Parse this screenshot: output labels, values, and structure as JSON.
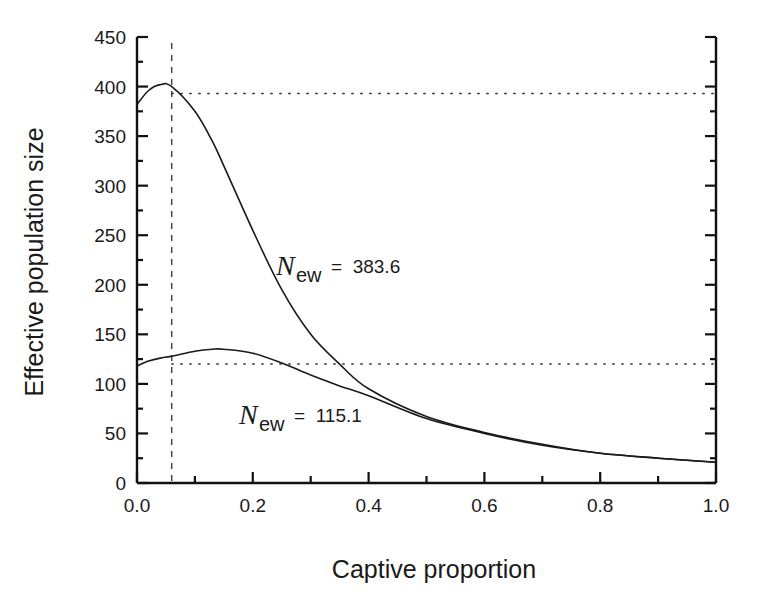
{
  "chart_data": {
    "type": "line",
    "title": "",
    "xlabel": "Captive proportion",
    "ylabel": "Effective population size",
    "xlim": [
      0.0,
      1.0
    ],
    "ylim": [
      0,
      450
    ],
    "grid": false,
    "legend": null,
    "x_ticks": [
      "0.0",
      "0.2",
      "0.4",
      "0.6",
      "0.8",
      "1.0"
    ],
    "y_ticks": [
      "0",
      "50",
      "100",
      "150",
      "200",
      "250",
      "300",
      "350",
      "400",
      "450"
    ],
    "x": [
      0.0,
      0.02,
      0.04,
      0.06,
      0.1,
      0.13,
      0.15,
      0.2,
      0.25,
      0.3,
      0.35,
      0.4,
      0.5,
      0.6,
      0.7,
      0.8,
      0.9,
      1.0
    ],
    "series": [
      {
        "name": "N_ew = 383.6",
        "values": [
          382,
          396,
          402,
          400,
          375,
          345,
          320,
          255,
          195,
          150,
          120,
          95,
          67,
          51,
          39,
          30,
          25,
          21
        ]
      },
      {
        "name": "N_ew = 115.1",
        "values": [
          118,
          123,
          126,
          128,
          133,
          135,
          135,
          131,
          121,
          109,
          98,
          88,
          65,
          50,
          38,
          30,
          25,
          21
        ]
      }
    ],
    "reference_lines": [
      {
        "type": "vertical",
        "style": "dashed",
        "x": 0.06
      },
      {
        "type": "horizontal",
        "style": "dotted",
        "y": 393,
        "from_x": 0.06,
        "to_x": 1.0
      },
      {
        "type": "horizontal",
        "style": "dotted",
        "y": 120,
        "from_x": 0.06,
        "to_x": 1.0
      }
    ],
    "annotations": [
      {
        "symbol": "N",
        "subscript": "ew",
        "text": "= 383.6",
        "target_series": 0
      },
      {
        "symbol": "N",
        "subscript": "ew",
        "text": "= 115.1",
        "target_series": 1
      }
    ]
  },
  "labels": {
    "xlabel": "Captive proportion",
    "ylabel": "Effective population size",
    "anno_upper_symbol": "N",
    "anno_upper_sub": "ew",
    "anno_upper_value": "=  383.6",
    "anno_lower_symbol": "N",
    "anno_lower_sub": "ew",
    "anno_lower_value": "=  115.1"
  },
  "colors": {
    "line": "#1a1a1a",
    "axis": "#111111",
    "reference": "#333333"
  }
}
